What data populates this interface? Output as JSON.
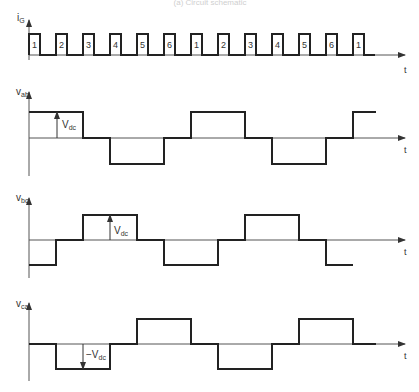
{
  "caption": "(a)  Circuit schematic",
  "time_label": "t",
  "gate_signal": {
    "label_main": "i",
    "label_sub": "G",
    "pulse_numbers": [
      "1",
      "2",
      "3",
      "4",
      "5",
      "6",
      "1",
      "2",
      "3",
      "4",
      "5",
      "6",
      "1"
    ]
  },
  "waveforms": [
    {
      "name": "vab",
      "label_main": "v",
      "label_sub": "ab",
      "annotation_main": "V",
      "annotation_sub": "dc",
      "annotation_sign": "",
      "levels": [
        1,
        1,
        0,
        -1,
        -1,
        0,
        1,
        1,
        0,
        -1,
        -1,
        0,
        1
      ]
    },
    {
      "name": "vbc",
      "label_main": "v",
      "label_sub": "bc",
      "annotation_main": "V",
      "annotation_sub": "dc",
      "annotation_sign": "",
      "levels": [
        -1,
        0,
        1,
        1,
        0,
        -1,
        -1,
        0,
        1,
        1,
        0,
        -1
      ]
    },
    {
      "name": "vca",
      "label_main": "v",
      "label_sub": "ca",
      "annotation_main": "V",
      "annotation_sub": "dc",
      "annotation_sign": "−",
      "levels": [
        0,
        -1,
        -1,
        0,
        1,
        1,
        0,
        -1,
        -1,
        0,
        1,
        1,
        0
      ]
    }
  ],
  "colors": {
    "trace": "#222222",
    "axis": "#555555",
    "text": "#333333"
  }
}
